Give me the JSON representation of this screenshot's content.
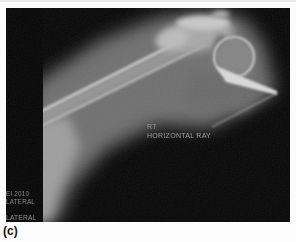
{
  "figure": {
    "label": "(c)"
  },
  "xray": {
    "annotations": {
      "side_marker": "RT",
      "projection": "HORIZONTAL RAY",
      "tech_id_line1": "EI 2010",
      "tech_id_line2": "LATERAL",
      "position_marker": "LATERAL"
    },
    "colors": {
      "film_background": "#060606",
      "annotation_text": "#a9a9a9",
      "marker_text": "#8f8f8f",
      "bone_highlight": "#c8c8c8",
      "soft_tissue": "#6f6f6f",
      "page_background": "#fcfcfc",
      "caption_text": "#141414"
    }
  }
}
